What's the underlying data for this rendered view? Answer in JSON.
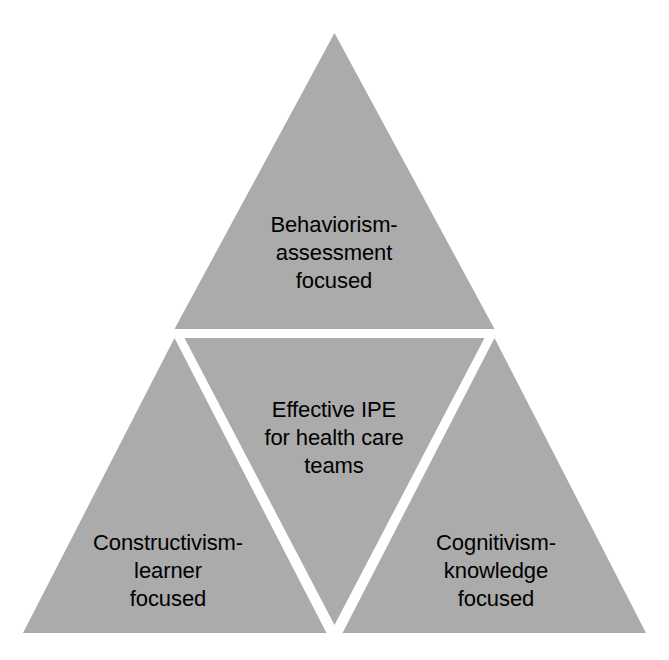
{
  "diagram": {
    "type": "subdivided-triangle",
    "shape_name": "triangle",
    "fill_color": "#ABABAB",
    "gap_color": "#FFFFFF",
    "text_color": "#000000",
    "background_color": "#FFFFFF",
    "segments": [
      {
        "id": "top",
        "position": "apex",
        "orientation": "upward",
        "lines": [
          "Behaviorism-",
          "assessment",
          "focused"
        ],
        "line1": "Behaviorism-",
        "line2": "assessment",
        "line3": "focused"
      },
      {
        "id": "center",
        "position": "center",
        "orientation": "inverted",
        "lines": [
          "Effective IPE",
          "for health care",
          "teams"
        ],
        "line1": "Effective IPE",
        "line2": "for health care",
        "line3": "teams"
      },
      {
        "id": "bottom_left",
        "position": "bottom-left",
        "orientation": "upward",
        "lines": [
          "Constructivism-",
          "learner",
          "focused"
        ],
        "line1": "Constructivism-",
        "line2": "learner",
        "line3": "focused"
      },
      {
        "id": "bottom_right",
        "position": "bottom-right",
        "orientation": "upward",
        "lines": [
          "Cognitivism-",
          "knowledge",
          "focused"
        ],
        "line1": "Cognitivism-",
        "line2": "knowledge",
        "line3": "focused"
      }
    ]
  }
}
